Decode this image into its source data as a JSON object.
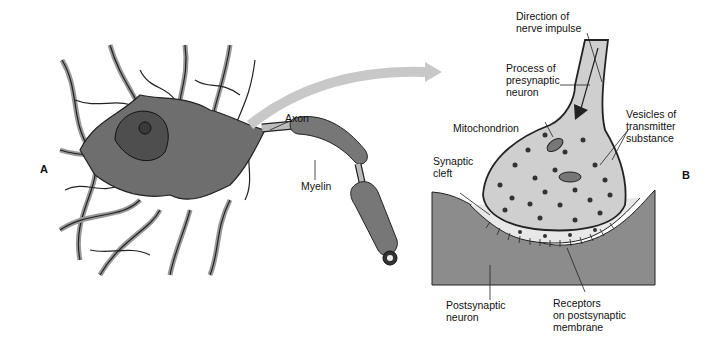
{
  "panels": {
    "a": {
      "letter": "A"
    },
    "b": {
      "letter": "B"
    }
  },
  "labels": {
    "axon": "Axon",
    "myelin": "Myelin",
    "direction": "Direction of\nnerve impulse",
    "process": "Process of\npresynaptic\nneuron",
    "mitochondrion": "Mitochondrion",
    "vesicles": "Vesicles of\ntransmitter\nsubstance",
    "synaptic_cleft": "Synaptic\ncleft",
    "postsynaptic_neuron": "Postsynaptic\nneuron",
    "receptors": "Receptors\non postsynaptic\nmembrane"
  },
  "colors": {
    "cell_body": "#6e6e6e",
    "dendrites": "#9a9a9a",
    "arrow": "#c8c8c8",
    "postsynaptic": "#8c8c8c",
    "terminal": "#cfcfcf",
    "vesicle": "#333333"
  }
}
